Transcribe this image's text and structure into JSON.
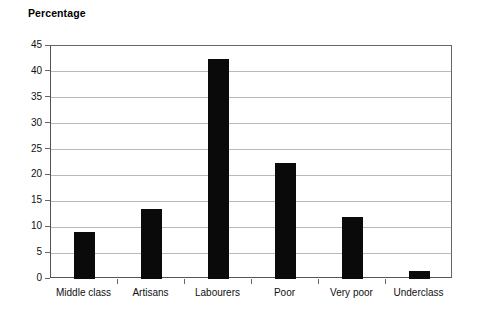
{
  "chart_data": {
    "type": "bar",
    "title": "Percentage",
    "xlabel": "",
    "ylabel": "",
    "categories": [
      "Middle class",
      "Artisans",
      "Labourers",
      "Poor",
      "Very poor",
      "Underclass"
    ],
    "values": [
      9,
      13.5,
      42.5,
      22.5,
      12,
      1.5
    ],
    "ylim": [
      0,
      45
    ],
    "yticks": [
      0,
      5,
      10,
      15,
      20,
      25,
      30,
      35,
      40,
      45
    ],
    "ytick_labels": [
      "0",
      "5",
      "10",
      "15",
      "20",
      "25",
      "30",
      "35",
      "40",
      "45"
    ],
    "grid": true,
    "legend": false,
    "bar_color": "#0a0a0a",
    "grid_color": "#b9b9b9",
    "axis_color": "#666666",
    "background": "#ffffff"
  }
}
